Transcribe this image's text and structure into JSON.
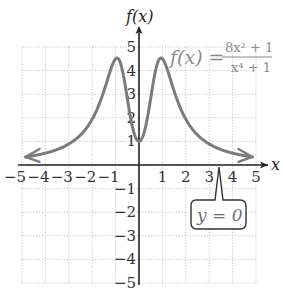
{
  "chart_data": {
    "type": "line",
    "title": "",
    "function": "f(x) = (8x^2 + 1) / (x^4 + 1)",
    "xlabel": "x",
    "ylabel": "f(x)",
    "xlim": [
      -5,
      5
    ],
    "ylim": [
      -5,
      5
    ],
    "grid": true,
    "x_ticks": [
      "-5",
      "-4",
      "-3",
      "-2",
      "-1",
      "1",
      "2",
      "3",
      "4",
      "5"
    ],
    "y_ticks": [
      "5",
      "4",
      "3",
      "2",
      "1",
      "-1",
      "-2",
      "-3",
      "-4",
      "-5"
    ],
    "series": [
      {
        "name": "f(x)",
        "x": [
          -5,
          -4,
          -3,
          -2,
          -1.5,
          -1,
          -0.5,
          0,
          0.5,
          1,
          1.5,
          2,
          3,
          4,
          5
        ],
        "values": [
          0.32,
          0.5,
          0.9,
          1.94,
          3.11,
          4.5,
          2.82,
          1,
          2.82,
          4.5,
          3.11,
          1.94,
          0.9,
          0.5,
          0.32
        ],
        "color": "#7b7b7b"
      }
    ],
    "annotations": [
      {
        "text": "y = 0",
        "kind": "horizontal asymptote callout",
        "points_to_x": 3.5
      },
      {
        "text": "f(x) = (8x^2 + 1)/(x^4 + 1)",
        "kind": "equation label",
        "placement": "top-right"
      }
    ],
    "asymptote": {
      "y": 0,
      "label": "y = 0"
    }
  },
  "labels": {
    "y_axis": "f(x)",
    "x_axis": "x",
    "eq_lhs": "f(x) =",
    "eq_num": "8x² + 1",
    "eq_den": "x⁴ + 1",
    "callout": "y = 0"
  }
}
